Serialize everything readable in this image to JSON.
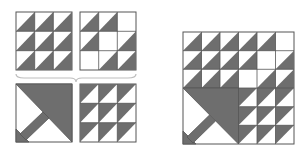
{
  "diagram": {
    "colors": {
      "dark": "#6e6e6e",
      "light": "#ffffff",
      "stroke": "#555555",
      "brace": "#bdbdbd"
    },
    "components": [
      {
        "id": "hst-grid-a",
        "label": "Top-left 3x3 half-square triangles",
        "grid": [
          [
            "hst",
            "hst",
            "hst"
          ],
          [
            "hst",
            "hst",
            "hst"
          ],
          [
            "hst",
            "hst",
            "hst"
          ]
        ],
        "orientation": "dark-lower-right"
      },
      {
        "id": "hst-grid-b",
        "label": "Top-right 3x3 mixed",
        "grid": [
          [
            "hst",
            "hst",
            "plain"
          ],
          [
            "hst",
            "plain",
            "hst"
          ],
          [
            "plain",
            "hst",
            "hst"
          ]
        ],
        "orientation": "dark-lower-right"
      },
      {
        "id": "basket-handle",
        "label": "Bottom-left basket handle block"
      },
      {
        "id": "hst-grid-c",
        "label": "Bottom-right 3x3 half-square triangles",
        "grid": [
          [
            "hst",
            "hst",
            "hst"
          ],
          [
            "hst",
            "hst",
            "hst"
          ],
          [
            "hst",
            "hst",
            "hst"
          ]
        ],
        "orientation": "dark-upper-left"
      }
    ],
    "result": {
      "label": "Assembled 6x6 basket block"
    }
  }
}
